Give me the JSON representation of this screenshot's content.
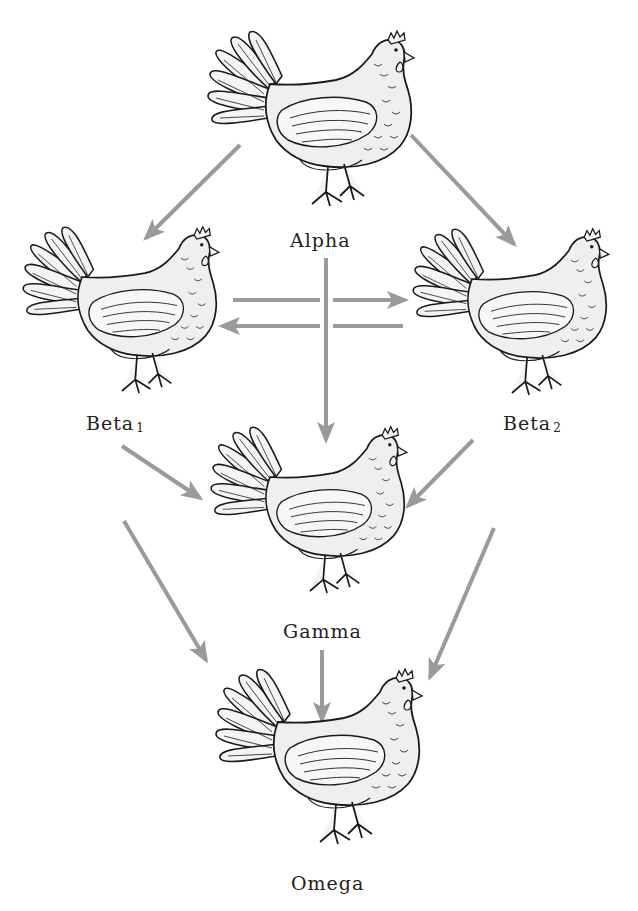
{
  "diagram": {
    "type": "dominance-hierarchy",
    "arrow_color": "#9a9a9a",
    "ink_color": "#1a1a1a",
    "nodes": [
      {
        "id": "alpha",
        "label": "Alpha",
        "sub": ""
      },
      {
        "id": "beta1",
        "label": "Beta",
        "sub": "1"
      },
      {
        "id": "beta2",
        "label": "Beta",
        "sub": "2"
      },
      {
        "id": "gamma",
        "label": "Gamma",
        "sub": ""
      },
      {
        "id": "omega",
        "label": "Omega",
        "sub": ""
      }
    ],
    "edges": [
      {
        "from": "alpha",
        "to": "beta1"
      },
      {
        "from": "alpha",
        "to": "beta2"
      },
      {
        "from": "alpha",
        "to": "gamma"
      },
      {
        "from": "beta1",
        "to": "beta2"
      },
      {
        "from": "beta2",
        "to": "beta1"
      },
      {
        "from": "beta1",
        "to": "gamma"
      },
      {
        "from": "beta2",
        "to": "gamma"
      },
      {
        "from": "beta1",
        "to": "omega"
      },
      {
        "from": "beta2",
        "to": "omega"
      },
      {
        "from": "gamma",
        "to": "omega"
      }
    ]
  }
}
